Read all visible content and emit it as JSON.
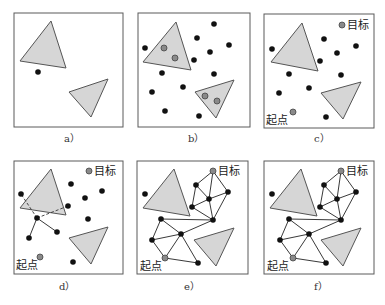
{
  "figure": {
    "labels": {
      "goal": "目标",
      "start": "起点"
    },
    "captions": [
      "a）",
      "b）",
      "c）",
      "d）",
      "e）",
      "f）"
    ]
  },
  "panels": [
    {
      "id": "a",
      "caption": "a）",
      "description": "Free space with two triangular obstacles and one sample"
    },
    {
      "id": "b",
      "caption": "b）",
      "description": "Random samples; samples inside obstacles marked gray"
    },
    {
      "id": "c",
      "caption": "c）",
      "description": "Collision-free samples with start and goal"
    },
    {
      "id": "d",
      "caption": "d）",
      "description": "Connecting neighbors, edges through obstacle rejected (dashed)"
    },
    {
      "id": "e",
      "caption": "e）",
      "description": "Roadmap graph built"
    },
    {
      "id": "f",
      "caption": "f）",
      "description": "Path search on roadmap from start to goal"
    }
  ],
  "colors": {
    "obstacle": "#d6d6d6",
    "node": "#111111",
    "special_node": "#8a8a8a",
    "frame": "#5a5a5a"
  }
}
